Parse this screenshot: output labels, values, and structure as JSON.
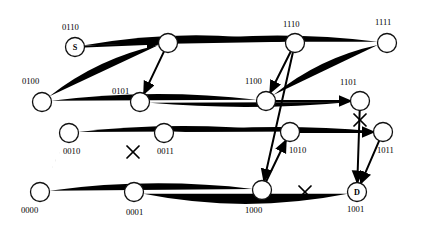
{
  "figure": {
    "node_radius": 9.5,
    "colors": {
      "edge": "#1a1a1a",
      "path": "#000000",
      "node_fill": "#ffffff",
      "node_stroke": "#111111",
      "fault": "#000000"
    }
  },
  "nodes": [
    {
      "id": "0110",
      "label": "0110",
      "inner": "S",
      "cx": 75,
      "cy": 47,
      "lx": 62,
      "ly": 30
    },
    {
      "id": "0111",
      "label": "0111",
      "inner": "",
      "cx": 168,
      "cy": 43,
      "lx": 182,
      "ly": 42
    },
    {
      "id": "1110",
      "label": "1110",
      "inner": "",
      "cx": 295,
      "cy": 43,
      "lx": 283,
      "ly": 27
    },
    {
      "id": "1111",
      "label": "1111",
      "inner": "",
      "cx": 387,
      "cy": 43,
      "lx": 375,
      "ly": 25
    },
    {
      "id": "0100",
      "label": "0100",
      "inner": "",
      "cx": 42,
      "cy": 102,
      "lx": 22,
      "ly": 84
    },
    {
      "id": "0101",
      "label": "0101",
      "inner": "",
      "cx": 140,
      "cy": 102,
      "lx": 112,
      "ly": 94
    },
    {
      "id": "1100",
      "label": "1100",
      "inner": "",
      "cx": 266,
      "cy": 101,
      "lx": 245,
      "ly": 84
    },
    {
      "id": "1101",
      "label": "1101",
      "inner": "",
      "cx": 360,
      "cy": 101,
      "lx": 340,
      "ly": 85
    },
    {
      "id": "0010",
      "label": "0010",
      "inner": "",
      "cx": 69,
      "cy": 133,
      "lx": 63,
      "ly": 154
    },
    {
      "id": "0011",
      "label": "0011",
      "inner": "",
      "cx": 164,
      "cy": 133,
      "lx": 157,
      "ly": 154
    },
    {
      "id": "1010",
      "label": "1010",
      "inner": "",
      "cx": 290,
      "cy": 132,
      "lx": 289,
      "ly": 153
    },
    {
      "id": "1011",
      "label": "1011",
      "inner": "",
      "cx": 383,
      "cy": 132,
      "lx": 377,
      "ly": 153
    },
    {
      "id": "0000",
      "label": "0000",
      "inner": "",
      "cx": 40,
      "cy": 192,
      "lx": 21,
      "ly": 213
    },
    {
      "id": "0001",
      "label": "0001",
      "inner": "",
      "cx": 134,
      "cy": 192,
      "lx": 126,
      "ly": 215
    },
    {
      "id": "1000",
      "label": "1000",
      "inner": "",
      "cx": 262,
      "cy": 190,
      "lx": 245,
      "ly": 213
    },
    {
      "id": "1001",
      "label": "1001",
      "inner": "D",
      "cx": 357,
      "cy": 192,
      "lx": 347,
      "ly": 212
    }
  ],
  "faults": [
    {
      "id": "fault-0001-0011",
      "x": 133,
      "y": 152
    },
    {
      "id": "fault-1101-1011",
      "x": 360,
      "y": 120
    },
    {
      "id": "fault-1000-1001",
      "x": 305,
      "y": 192
    }
  ],
  "route": {
    "source": "0110",
    "destination": "1001",
    "hops": [
      "0110 -> 0111",
      "0111 -> 0101",
      "1110 -> 1100",
      "1100 -> 1101",
      "1101 -> 1001",
      "1110 -> 1000",
      "1000 -> 1010",
      "1010 -> 1011",
      "1011 -> 1001"
    ]
  },
  "dimension_labels": {
    "bits": 4,
    "source_marker": "S",
    "destination_marker": "D"
  }
}
